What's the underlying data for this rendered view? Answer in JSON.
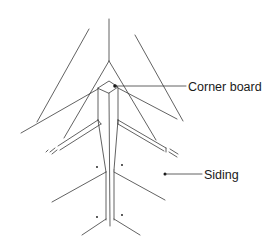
{
  "diagram": {
    "labels": {
      "corner_board": "Corner board",
      "siding": "Siding"
    },
    "colors": {
      "line": "#3a3a3a",
      "text": "#1a1a1a",
      "background": "#ffffff"
    }
  }
}
